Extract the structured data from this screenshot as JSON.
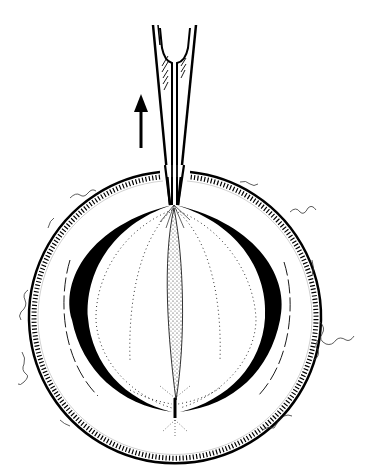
{
  "figure": {
    "colors": {
      "ink": "#000000",
      "background": "#ffffff",
      "stipple": "#333333"
    },
    "elements": {
      "arrow": {
        "label": "upward-arrow",
        "direction": "up"
      },
      "instrument": {
        "label": "forceps-instrument"
      },
      "outer_ring": {
        "label": "outer-hatched-ring"
      },
      "crescents": {
        "label": "black-crescents"
      },
      "lens": {
        "label": "stippled-spindle"
      }
    }
  }
}
